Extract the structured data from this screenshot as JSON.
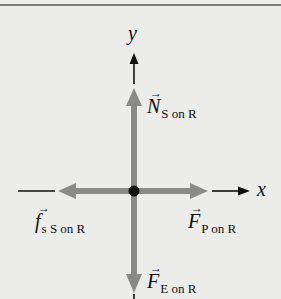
{
  "diagram": {
    "type": "free-body diagram",
    "axes": {
      "x_label": "x",
      "y_label": "y"
    },
    "object": {
      "name": "R",
      "center": [
        134,
        191
      ]
    },
    "forces": [
      {
        "id": "normal",
        "symbol": "N",
        "subscript": "S on R",
        "direction": "up",
        "color": "#8a8a8a"
      },
      {
        "id": "friction",
        "symbol": "f",
        "subscript_lower": "s",
        "subscript": "S on R",
        "direction": "left",
        "color": "#8a8a8a"
      },
      {
        "id": "push",
        "symbol": "F",
        "subscript": "P on R",
        "direction": "right",
        "color": "#8a8a8a"
      },
      {
        "id": "gravity",
        "symbol": "F",
        "subscript": "E on R",
        "direction": "down",
        "color": "#8a8a8a"
      }
    ],
    "vector_arrow_glyph": "→",
    "colors": {
      "background": "#ececea",
      "force_arrow": "#8a8a8a",
      "axis": "#111111",
      "dot": "#111111"
    }
  }
}
